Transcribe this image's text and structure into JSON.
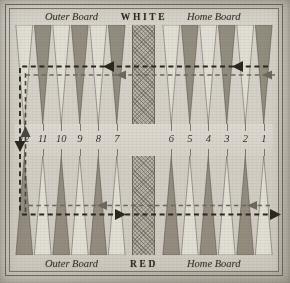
{
  "figure": {
    "name": "backgammon-board-diagram"
  },
  "top_labels": {
    "outer_board": "Outer Board",
    "side": "WHITE",
    "home_board": "Home Board"
  },
  "bottom_labels": {
    "outer_board": "Outer Board",
    "side": "RED",
    "home_board": "Home Board"
  },
  "bar": {
    "label": "BAR"
  },
  "point_numbers": {
    "left_half": [
      "12",
      "11",
      "10",
      "9",
      "8",
      "7"
    ],
    "right_half": [
      "6",
      "5",
      "4",
      "3",
      "2",
      "1"
    ]
  },
  "points": {
    "count_per_row": 12,
    "top_row_colors": [
      "light",
      "dark",
      "light",
      "dark",
      "light",
      "dark",
      "light",
      "dark",
      "light",
      "dark",
      "light",
      "dark"
    ],
    "bottom_row_colors": [
      "dark",
      "light",
      "dark",
      "light",
      "dark",
      "light",
      "dark",
      "light",
      "dark",
      "light",
      "dark",
      "light"
    ]
  },
  "arrows": [
    {
      "name": "top-outer-path",
      "direction": "left",
      "style": "dashed"
    },
    {
      "name": "top-inner-path",
      "direction": "left",
      "style": "dashed"
    },
    {
      "name": "bottom-inner-path",
      "direction": "left",
      "style": "dashed"
    },
    {
      "name": "bottom-outer-path",
      "direction": "right",
      "style": "dashed"
    },
    {
      "name": "left-vertical-up-path",
      "direction": "up",
      "style": "dashed"
    },
    {
      "name": "left-vertical-down-path",
      "direction": "down",
      "style": "dashed"
    }
  ],
  "colors": {
    "paper": "#d0ccc3",
    "point_light": "#e2ded5",
    "point_dark": "#8d8779",
    "ink": "#34302a",
    "frame": "#6e685e",
    "bar_fill": "#b9b3a8"
  }
}
